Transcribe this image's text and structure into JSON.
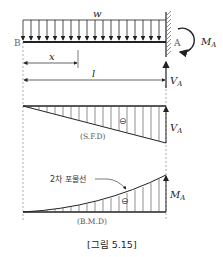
{
  "figure": {
    "caption": "[그림 5.15]",
    "beam": {
      "load_label": "w",
      "free_end_label": "B",
      "fixed_end_label": "A",
      "moment_label": "M",
      "moment_sub": "A",
      "reaction_label": "V",
      "reaction_sub": "A",
      "x_label": "x",
      "length_label": "l"
    },
    "sfd": {
      "label": "(S.F.D)",
      "sign": "⊖",
      "end_label": "V",
      "end_sub": "A"
    },
    "bmd": {
      "label": "(B.M.D)",
      "sign": "⊖",
      "end_label": "M",
      "end_sub": "A",
      "curve_note": "2차 포물선"
    },
    "colors": {
      "line": "#222222",
      "hatch": "#444444",
      "guide": "#999999"
    }
  }
}
